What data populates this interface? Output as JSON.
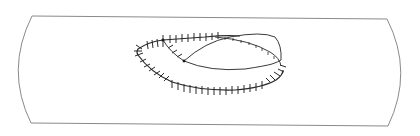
{
  "figure": {
    "type": "line-drawing",
    "colors": {
      "background": "#ffffff",
      "outline": "#8a8a8a",
      "suture": "#2a2a2a"
    },
    "elements": [
      {
        "name": "tube-outline",
        "description": "cylindrical segment with curved ends"
      },
      {
        "name": "outer-suture-line",
        "description": "continuous stitched loop with cross ticks"
      },
      {
        "name": "inner-flap-curves",
        "description": "two curves meeting at a knot forming a lens-shaped flap"
      },
      {
        "name": "fine-suture-line",
        "description": "upper curve with small ticks"
      }
    ]
  }
}
